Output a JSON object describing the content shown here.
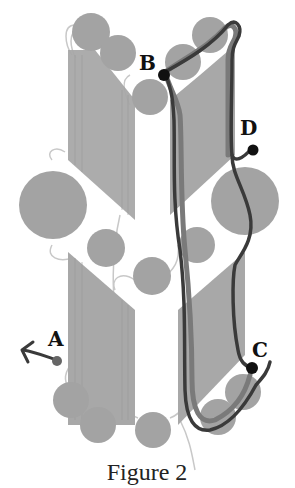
{
  "figure": {
    "caption": "Figure 2",
    "labels": {
      "A": "A",
      "B": "B",
      "C": "C",
      "D": "D"
    },
    "colors": {
      "helix": "#a3a3a3",
      "sheet": "#a8a8a8",
      "loop": "#c8c8c8",
      "trace_dark": "#3a3a3a",
      "trace_mid": "#777777",
      "marker": "#111111",
      "marker_a": "#666666"
    }
  }
}
